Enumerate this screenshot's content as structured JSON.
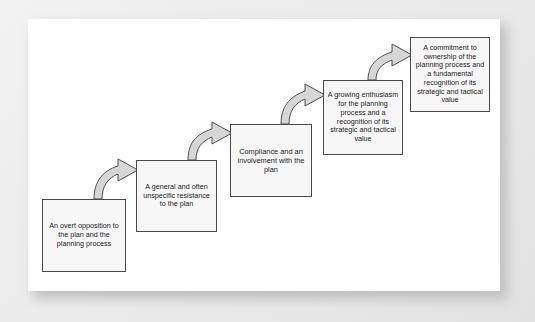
{
  "diagram": {
    "type": "stepped-flow",
    "title": "",
    "background_color": "#ffffff",
    "box_fill_color": "#f7f7f7",
    "box_border_color": "#4a4a4a",
    "arrow_fill_color": "#d6d6d6",
    "arrow_border_color": "#4f4f4f",
    "stages": [
      {
        "id": 1,
        "label": "An overt opposition to the plan and the planning process"
      },
      {
        "id": 2,
        "label": "A general and often unspecific resistance to the plan"
      },
      {
        "id": 3,
        "label": "Compliance and an involvement with the plan"
      },
      {
        "id": 4,
        "label": "A growing enthusiasm for the planning process and a recognition of its strategic and tactical value"
      },
      {
        "id": 5,
        "label": "A commitment to ownership of the planning process and a fundamental recognition of its strategic and tactical value"
      }
    ],
    "connectors": [
      {
        "id": 1,
        "from": 1,
        "to": 2,
        "shape": "curved-block-arrow"
      },
      {
        "id": 2,
        "from": 2,
        "to": 3,
        "shape": "curved-block-arrow"
      },
      {
        "id": 3,
        "from": 3,
        "to": 4,
        "shape": "curved-block-arrow"
      },
      {
        "id": 4,
        "from": 4,
        "to": 5,
        "shape": "curved-block-arrow"
      }
    ]
  }
}
